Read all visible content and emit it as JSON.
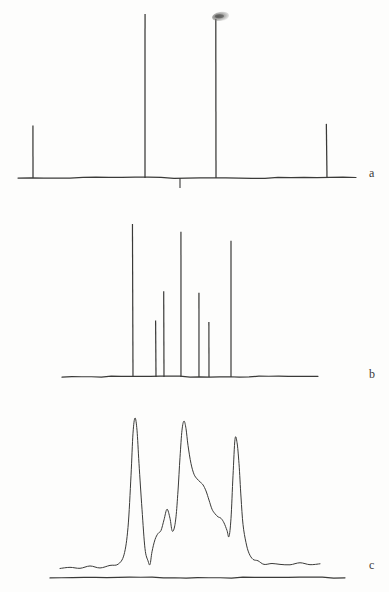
{
  "figure": {
    "background_color": "#fdfdfc",
    "ink_color": "#3a3a38",
    "panels": [
      {
        "id": "a",
        "label": "a",
        "type": "stick-spectrum",
        "description": "Calculated stick spectrum with four lines and one downward reference tick"
      },
      {
        "id": "b",
        "label": "b",
        "type": "stick-spectrum",
        "description": "Calculated stick spectrum with seven lines of varying intensity"
      },
      {
        "id": "c",
        "label": "c",
        "type": "line",
        "description": "Experimental continuous trace with three main bands, shoulders and baseline noise"
      }
    ]
  },
  "chart_data": [
    {
      "type": "bar",
      "panel": "a",
      "title": "",
      "xlabel": "",
      "ylabel": "",
      "legend": "none",
      "grid": false,
      "xlim": [
        0,
        389
      ],
      "ylim": [
        0,
        1
      ],
      "baseline_y_px": 178,
      "axis_x_start_px": 18,
      "axis_x_end_px": 356,
      "categories": [
        "line 1",
        "line 2",
        "line 3",
        "line 4"
      ],
      "x_px": [
        33,
        145,
        216,
        327
      ],
      "values": [
        0.32,
        1.0,
        0.97,
        0.33
      ],
      "tick_marks": [
        {
          "x_px": 180,
          "direction": "down",
          "length_px": 10
        }
      ],
      "artifacts": [
        {
          "name": "ink-smudge",
          "x_px": 220,
          "y_px": 16,
          "width_px": 17,
          "height_px": 9
        }
      ]
    },
    {
      "type": "bar",
      "panel": "b",
      "title": "",
      "xlabel": "",
      "ylabel": "",
      "legend": "none",
      "grid": false,
      "xlim": [
        0,
        389
      ],
      "ylim": [
        0,
        1
      ],
      "baseline_y_px": 377,
      "axis_x_start_px": 62,
      "axis_x_end_px": 318,
      "categories": [
        "line 1",
        "line 2",
        "line 3",
        "line 4",
        "line 5",
        "line 6",
        "line 7"
      ],
      "x_px": [
        133,
        156,
        164,
        181,
        199,
        209,
        231
      ],
      "values": [
        1.0,
        0.37,
        0.56,
        0.95,
        0.55,
        0.36,
        0.89
      ]
    },
    {
      "type": "line",
      "panel": "c",
      "title": "",
      "xlabel": "",
      "ylabel": "",
      "legend": "none",
      "grid": false,
      "xlim": [
        0,
        389
      ],
      "ylim": [
        0,
        1
      ],
      "baseline_y_px": 578,
      "trace_zero_y_px": 570,
      "axis_x_start_px": 60,
      "axis_x_end_px": 320,
      "peaks": [
        {
          "name": "band 1",
          "x_px": 135,
          "value": 1.0
        },
        {
          "name": "shoulder 1",
          "x_px": 167,
          "value": 0.4
        },
        {
          "name": "band 2",
          "x_px": 184,
          "value": 0.98
        },
        {
          "name": "shoulder 2",
          "x_px": 205,
          "value": 0.56
        },
        {
          "name": "shoulder 3",
          "x_px": 218,
          "value": 0.35
        },
        {
          "name": "band 3",
          "x_px": 235,
          "value": 0.86
        }
      ],
      "x": [
        60,
        70,
        80,
        90,
        100,
        110,
        118,
        124,
        128,
        131,
        133,
        135,
        137,
        139,
        142,
        145,
        148,
        150,
        152,
        155,
        158,
        161,
        164,
        167,
        170,
        172,
        174,
        176,
        178,
        180,
        182,
        184,
        186,
        188,
        191,
        194,
        197,
        200,
        203,
        206,
        209,
        212,
        215,
        218,
        221,
        224,
        227,
        229,
        231,
        233,
        235,
        237,
        239,
        241,
        243,
        246,
        249,
        253,
        258,
        264,
        272,
        280,
        290,
        300,
        310,
        320
      ],
      "y": [
        0.01,
        0.012,
        0.01,
        0.013,
        0.015,
        0.02,
        0.04,
        0.1,
        0.28,
        0.62,
        0.9,
        1.0,
        0.92,
        0.7,
        0.4,
        0.14,
        0.05,
        0.04,
        0.12,
        0.2,
        0.24,
        0.26,
        0.33,
        0.4,
        0.34,
        0.26,
        0.27,
        0.35,
        0.52,
        0.74,
        0.92,
        0.98,
        0.93,
        0.82,
        0.7,
        0.63,
        0.6,
        0.58,
        0.56,
        0.52,
        0.46,
        0.4,
        0.37,
        0.35,
        0.34,
        0.31,
        0.26,
        0.22,
        0.34,
        0.62,
        0.86,
        0.84,
        0.7,
        0.48,
        0.3,
        0.18,
        0.11,
        0.07,
        0.05,
        0.04,
        0.035,
        0.03,
        0.035,
        0.04,
        0.035,
        0.03
      ]
    }
  ]
}
